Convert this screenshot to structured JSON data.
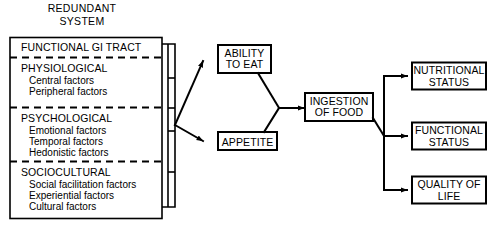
{
  "figure": {
    "title_line1": "REDUNDANT",
    "title_line2": "SYSTEM"
  },
  "left_panel": {
    "name": "redundant-system-panel",
    "sections": [
      {
        "heading": "FUNCTIONAL GI TRACT",
        "items": []
      },
      {
        "heading": "PHYSIOLOGICAL",
        "items": [
          "Central factors",
          "Peripheral factors"
        ]
      },
      {
        "heading": "PSYCHOLOGICAL",
        "items": [
          "Emotional factors",
          "Temporal factors",
          "Hedonistic factors"
        ]
      },
      {
        "heading": "SOCIOCULTURAL",
        "items": [
          "Social facilitation factors",
          "Experiential factors",
          "Cultural factors"
        ]
      }
    ]
  },
  "nodes": {
    "ability_to_eat": {
      "line1": "ABILITY",
      "line2": "TO EAT"
    },
    "appetite": {
      "line1": "APPETITE",
      "line2": ""
    },
    "ingestion_of_food": {
      "line1": "INGESTION",
      "line2": "OF FOOD"
    },
    "nutritional_status": {
      "line1": "NUTRITIONAL",
      "line2": "STATUS"
    },
    "functional_status": {
      "line1": "FUNCTIONAL",
      "line2": "STATUS"
    },
    "quality_of_life": {
      "line1": "QUALITY OF",
      "line2": "LIFE"
    }
  },
  "colors": {
    "stroke": "#000000",
    "fill": "#ffffff",
    "background": "#ffffff"
  }
}
